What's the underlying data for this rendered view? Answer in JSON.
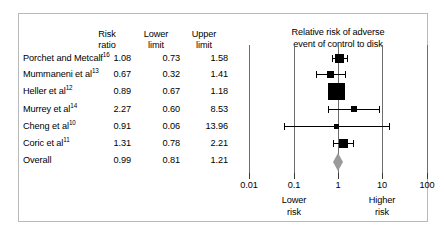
{
  "table": {
    "headers": [
      "Risk\nratio",
      "Lower\nlimit",
      "Upper\nlimit"
    ],
    "rows": [
      {
        "study": "Porchet and Metcalf",
        "ref": "16",
        "rr": "1.08",
        "lower": "0.73",
        "upper": "1.58"
      },
      {
        "study": "Mummaneni et al",
        "ref": "13",
        "rr": "0.67",
        "lower": "0.32",
        "upper": "1.41"
      },
      {
        "study": "Heller et al",
        "ref": "12",
        "rr": "0.89",
        "lower": "0.67",
        "upper": "1.18"
      },
      {
        "study": "Murrey et al",
        "ref": "14",
        "rr": "2.27",
        "lower": "0.60",
        "upper": "8.53"
      },
      {
        "study": "Cheng et al",
        "ref": "10",
        "rr": "0.91",
        "lower": "0.06",
        "upper": "13.96"
      },
      {
        "study": "Coric et al",
        "ref": "11",
        "rr": "1.31",
        "lower": "0.78",
        "upper": "2.21"
      },
      {
        "study": "Overall",
        "ref": "",
        "rr": "0.99",
        "lower": "0.81",
        "upper": "1.21"
      }
    ]
  },
  "plot": {
    "title": "Relative risk of adverse\nevent of control to disk",
    "axis_ticks": [
      "0.01",
      "0.1",
      "1",
      "10",
      "100"
    ],
    "left_note": "Lower\nrisk",
    "right_note": "Higher\nrisk",
    "marker_color": "#000000",
    "diamond_color": "#9a9a9a",
    "gridline_color": "#6d6d6d"
  },
  "chart_data": {
    "type": "forest",
    "title": "Relative risk of adverse event of control to disk",
    "xlabel": "",
    "ylabel": "",
    "xscale": "log",
    "xlim": [
      0.01,
      100
    ],
    "xticks": [
      0.01,
      0.1,
      1,
      10,
      100
    ],
    "null_line": 1,
    "grid": true,
    "legend": "none",
    "left_axis_note": "Lower risk",
    "right_axis_note": "Higher risk",
    "columns": [
      "Risk ratio",
      "Lower limit",
      "Upper limit"
    ],
    "studies": [
      {
        "label": "Porchet and Metcalf",
        "ref": 16,
        "rr": 1.08,
        "lower": 0.73,
        "upper": 1.58,
        "weight": 0.42,
        "marker": "square"
      },
      {
        "label": "Mummaneni et al",
        "ref": 13,
        "rr": 0.67,
        "lower": 0.32,
        "upper": 1.41,
        "weight": 0.24,
        "marker": "square"
      },
      {
        "label": "Heller et al",
        "ref": 12,
        "rr": 0.89,
        "lower": 0.67,
        "upper": 1.18,
        "weight": 1.0,
        "marker": "square"
      },
      {
        "label": "Murrey et al",
        "ref": 14,
        "rr": 2.27,
        "lower": 0.6,
        "upper": 8.53,
        "weight": 0.16,
        "marker": "square"
      },
      {
        "label": "Cheng et al",
        "ref": 10,
        "rr": 0.91,
        "lower": 0.06,
        "upper": 13.96,
        "weight": 0.09,
        "marker": "square"
      },
      {
        "label": "Coric et al",
        "ref": 11,
        "rr": 1.31,
        "lower": 0.78,
        "upper": 2.21,
        "weight": 0.36,
        "marker": "square"
      },
      {
        "label": "Overall",
        "ref": null,
        "rr": 0.99,
        "lower": 0.81,
        "upper": 1.21,
        "weight": null,
        "marker": "diamond"
      }
    ]
  },
  "geometry": {
    "row_top": [
      52,
      68,
      85,
      103,
      120,
      137,
      154
    ],
    "axis_y": 178,
    "px_per_decade": 44.3,
    "x_at_one": 337
  }
}
